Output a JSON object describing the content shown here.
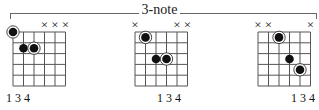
{
  "header": {
    "label": "3-note"
  },
  "colors": {
    "grid": "#555555",
    "dot": "#111111",
    "ring": "#333333"
  },
  "diagrams": [
    {
      "name": "diagram-1",
      "left": 0,
      "muted_strings": [
        4,
        5,
        6
      ],
      "mute_symbol": "×",
      "dots": [
        {
          "string": 1,
          "fret": 0,
          "root": true
        },
        {
          "string": 2,
          "fret": 2,
          "root": false
        },
        {
          "string": 3,
          "fret": 2,
          "root": true
        }
      ],
      "finger_label": "1 3 4",
      "finger_label_x": 6
    },
    {
      "name": "diagram-2",
      "left": 122,
      "muted_strings": [
        1,
        5,
        6
      ],
      "mute_symbol": "×",
      "dots": [
        {
          "string": 2,
          "fret": 1,
          "root": true
        },
        {
          "string": 3,
          "fret": 3,
          "root": false
        },
        {
          "string": 4,
          "fret": 3,
          "root": true
        }
      ],
      "finger_label": "1 3 4",
      "finger_label_x": 35
    },
    {
      "name": "diagram-3",
      "left": 245,
      "muted_strings": [
        1,
        2,
        6
      ],
      "mute_symbol": "×",
      "dots": [
        {
          "string": 3,
          "fret": 1,
          "root": true
        },
        {
          "string": 4,
          "fret": 3,
          "root": false
        },
        {
          "string": 5,
          "fret": 4,
          "root": true
        }
      ],
      "finger_label": "1 3 4",
      "finger_label_x": 46
    }
  ]
}
